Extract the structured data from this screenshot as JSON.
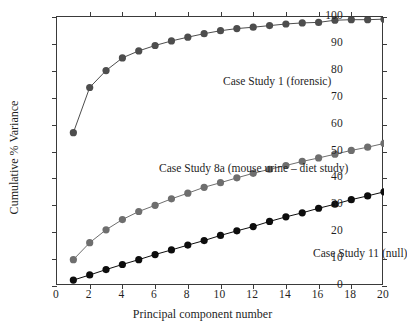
{
  "chart_data": {
    "type": "line",
    "title": "",
    "subtitle": "",
    "xlabel": "Principal component number",
    "ylabel": "Cumulative % Variance",
    "xlim": [
      0,
      20
    ],
    "ylim": [
      0,
      100
    ],
    "xticks": [
      0,
      2,
      4,
      6,
      8,
      10,
      12,
      14,
      16,
      18,
      20
    ],
    "yticks": [
      0,
      10,
      20,
      30,
      40,
      50,
      60,
      70,
      80,
      90,
      100
    ],
    "xtick_labels": [
      "0",
      "2",
      "4",
      "6",
      "8",
      "10",
      "12",
      "14",
      "16",
      "18",
      "20"
    ],
    "ytick_labels": [
      "0",
      "10",
      "20",
      "30",
      "40",
      "50",
      "60",
      "70",
      "80",
      "90",
      "100"
    ],
    "grid": false,
    "legend_position": "inline-annotations",
    "x": [
      1,
      2,
      3,
      4,
      5,
      6,
      7,
      8,
      9,
      10,
      11,
      12,
      13,
      14,
      15,
      16,
      17,
      18,
      19,
      20
    ],
    "series": [
      {
        "name": "Case Study 1 (forensic)",
        "color": "#4d4d4d",
        "marker": "circle",
        "values": [
          57.0,
          73.8,
          80.1,
          84.8,
          87.4,
          89.4,
          91.1,
          92.5,
          93.8,
          94.9,
          95.7,
          96.2,
          96.8,
          97.4,
          97.8,
          98.0,
          98.8,
          99.0,
          99.0,
          99.2
        ]
      },
      {
        "name": "Case Study 8a (mouse urine – diet study)",
        "color": "#6e6e6e",
        "marker": "circle",
        "values": [
          9.8,
          16.1,
          20.9,
          24.7,
          27.7,
          30.0,
          32.4,
          34.5,
          36.7,
          38.4,
          40.2,
          41.9,
          43.4,
          44.8,
          46.3,
          47.6,
          49.0,
          50.4,
          51.6,
          53.0
        ]
      },
      {
        "name": "Case Study 11 (null)",
        "color": "#0d0d0d",
        "marker": "circle",
        "values": [
          2.2,
          4.1,
          6.1,
          8.0,
          9.8,
          11.7,
          13.4,
          15.2,
          16.9,
          18.8,
          20.5,
          22.1,
          24.0,
          25.7,
          27.2,
          28.9,
          30.4,
          32.1,
          33.5,
          35.0
        ]
      }
    ],
    "annotations": [
      {
        "text": "Case Study 1 (forensic)",
        "series": 0
      },
      {
        "text": "Case Study 8a (mouse urine – diet study)",
        "series": 1
      },
      {
        "text": "Case Study 11 (null)",
        "series": 2
      }
    ]
  }
}
